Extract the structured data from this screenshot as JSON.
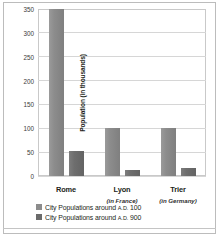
{
  "chart_data": {
    "type": "bar",
    "title": "",
    "xlabel": "",
    "ylabel": "Population (in thousands)",
    "ylabel_main": "Population",
    "ylabel_sub": "(in thousands)",
    "ylim": [
      0,
      350
    ],
    "ytick_labels": [
      "0",
      "50",
      "100",
      "150",
      "200",
      "250",
      "300",
      "350"
    ],
    "ytick_values": [
      0,
      50,
      100,
      150,
      200,
      250,
      300,
      350
    ],
    "grid": true,
    "legend_position": "bottom-left",
    "categories": [
      "Rome",
      "Lyon",
      "Trier"
    ],
    "category_subtitles": [
      "",
      "(in France)",
      "(in Germany)"
    ],
    "series": [
      {
        "name": "City Populations around A.D. 100",
        "name_prefix": "City Populations around ",
        "era": "A.D.",
        "year": "100",
        "color": "#8c8c8c",
        "values": [
          350,
          100,
          100
        ]
      },
      {
        "name": "City Populations around A.D. 900",
        "name_prefix": "City Populations around ",
        "era": "A.D.",
        "year": "900",
        "color": "#6b6b6b",
        "values": [
          52,
          13,
          16
        ]
      }
    ]
  }
}
